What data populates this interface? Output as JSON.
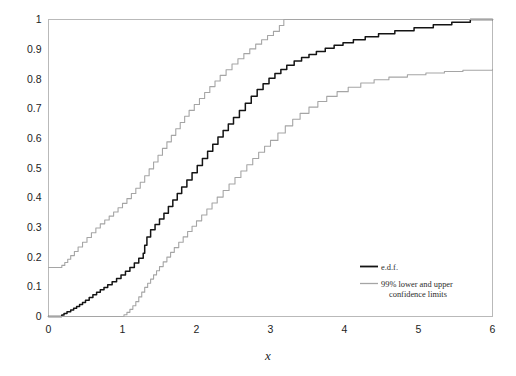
{
  "chart_data": {
    "type": "line",
    "title": "",
    "subtitle": "",
    "xlabel": "x",
    "ylabel": "",
    "xlim": [
      0,
      6
    ],
    "ylim": [
      0,
      1
    ],
    "grid": false,
    "legend_position": "center-right",
    "xticks": [
      "0",
      "1",
      "2",
      "3",
      "4",
      "5",
      "6"
    ],
    "xtick_values": [
      0,
      1,
      2,
      3,
      4,
      5,
      6
    ],
    "yticks": [
      "0",
      "0.1",
      "0.2",
      "0.3",
      "0.4",
      "0.5",
      "0.6",
      "0.7",
      "0.8",
      "0.9",
      "1"
    ],
    "ytick_values": [
      0,
      0.1,
      0.2,
      0.3,
      0.4,
      0.5,
      0.6,
      0.7,
      0.8,
      0.9,
      1.0
    ],
    "colors": {
      "edf": "#141414",
      "confidence": "#a5a5a5",
      "frame": "#b9b9b9",
      "text": "#1d1d1d",
      "background": "#ffffff"
    },
    "series": [
      {
        "name": "e.d.f.",
        "role": "empirical-distribution-function",
        "color": "#141414",
        "step": "post",
        "x": [
          0.0,
          0.18,
          0.21,
          0.25,
          0.3,
          0.34,
          0.38,
          0.42,
          0.46,
          0.5,
          0.55,
          0.6,
          0.65,
          0.7,
          0.75,
          0.8,
          0.86,
          0.92,
          0.98,
          1.04,
          1.1,
          1.16,
          1.22,
          1.28,
          1.3,
          1.33,
          1.38,
          1.44,
          1.5,
          1.56,
          1.62,
          1.68,
          1.74,
          1.8,
          1.87,
          1.94,
          2.01,
          2.08,
          2.15,
          2.22,
          2.29,
          2.36,
          2.43,
          2.5,
          2.58,
          2.66,
          2.74,
          2.82,
          2.9,
          2.98,
          3.06,
          3.14,
          3.22,
          3.32,
          3.42,
          3.52,
          3.62,
          3.74,
          3.86,
          3.98,
          4.12,
          4.28,
          4.46,
          4.68,
          4.94,
          5.2,
          5.45,
          5.7,
          6.0
        ],
        "y": [
          0.0,
          0.005,
          0.01,
          0.016,
          0.022,
          0.028,
          0.034,
          0.04,
          0.047,
          0.055,
          0.064,
          0.073,
          0.082,
          0.09,
          0.098,
          0.107,
          0.117,
          0.128,
          0.14,
          0.152,
          0.165,
          0.18,
          0.196,
          0.213,
          0.24,
          0.268,
          0.292,
          0.31,
          0.328,
          0.348,
          0.37,
          0.392,
          0.414,
          0.436,
          0.46,
          0.484,
          0.508,
          0.532,
          0.556,
          0.58,
          0.604,
          0.626,
          0.648,
          0.67,
          0.694,
          0.718,
          0.742,
          0.764,
          0.784,
          0.802,
          0.818,
          0.832,
          0.846,
          0.86,
          0.872,
          0.882,
          0.892,
          0.903,
          0.913,
          0.922,
          0.932,
          0.942,
          0.952,
          0.962,
          0.972,
          0.982,
          0.991,
          1.0,
          1.0
        ]
      },
      {
        "name": "99% upper confidence limit",
        "role": "upper-confidence-limit",
        "color": "#a5a5a5",
        "step": "post",
        "x": [
          0.0,
          0.15,
          0.18,
          0.22,
          0.26,
          0.3,
          0.35,
          0.4,
          0.46,
          0.52,
          0.58,
          0.64,
          0.7,
          0.76,
          0.82,
          0.88,
          0.94,
          1.0,
          1.06,
          1.12,
          1.18,
          1.24,
          1.3,
          1.36,
          1.42,
          1.48,
          1.54,
          1.6,
          1.66,
          1.72,
          1.78,
          1.84,
          1.9,
          1.97,
          2.04,
          2.11,
          2.18,
          2.25,
          2.32,
          2.4,
          2.48,
          2.56,
          2.64,
          2.72,
          2.8,
          2.88,
          2.96,
          3.04,
          3.12,
          3.18,
          6.0
        ],
        "y": [
          0.165,
          0.165,
          0.172,
          0.182,
          0.193,
          0.205,
          0.219,
          0.234,
          0.25,
          0.266,
          0.282,
          0.298,
          0.312,
          0.325,
          0.338,
          0.352,
          0.366,
          0.381,
          0.397,
          0.414,
          0.432,
          0.452,
          0.474,
          0.497,
          0.52,
          0.543,
          0.566,
          0.588,
          0.61,
          0.632,
          0.653,
          0.674,
          0.694,
          0.714,
          0.734,
          0.754,
          0.774,
          0.793,
          0.812,
          0.831,
          0.85,
          0.868,
          0.885,
          0.901,
          0.917,
          0.932,
          0.946,
          0.96,
          0.98,
          1.0,
          1.0
        ]
      },
      {
        "name": "99% lower confidence limit",
        "role": "lower-confidence-limit",
        "color": "#a5a5a5",
        "step": "post",
        "x": [
          0.0,
          0.98,
          1.02,
          1.06,
          1.1,
          1.14,
          1.18,
          1.22,
          1.26,
          1.3,
          1.34,
          1.38,
          1.42,
          1.46,
          1.5,
          1.55,
          1.6,
          1.65,
          1.7,
          1.76,
          1.82,
          1.88,
          1.94,
          2.0,
          2.07,
          2.14,
          2.21,
          2.28,
          2.36,
          2.44,
          2.52,
          2.6,
          2.68,
          2.76,
          2.84,
          2.92,
          3.0,
          3.1,
          3.2,
          3.3,
          3.4,
          3.52,
          3.64,
          3.76,
          3.9,
          4.05,
          4.22,
          4.4,
          4.6,
          4.85,
          5.1,
          5.35,
          5.6,
          6.0
        ],
        "y": [
          0.0,
          0.0,
          0.006,
          0.014,
          0.024,
          0.036,
          0.05,
          0.066,
          0.082,
          0.098,
          0.112,
          0.126,
          0.14,
          0.154,
          0.168,
          0.184,
          0.2,
          0.216,
          0.232,
          0.25,
          0.268,
          0.286,
          0.304,
          0.322,
          0.342,
          0.362,
          0.382,
          0.402,
          0.424,
          0.446,
          0.468,
          0.49,
          0.511,
          0.532,
          0.553,
          0.573,
          0.593,
          0.618,
          0.642,
          0.664,
          0.684,
          0.705,
          0.724,
          0.741,
          0.757,
          0.772,
          0.786,
          0.797,
          0.806,
          0.814,
          0.82,
          0.825,
          0.829,
          0.832
        ]
      }
    ],
    "legend": [
      {
        "label": "e.d.f.",
        "color": "#141414"
      },
      {
        "label": "99%  lower and upper",
        "label2": "confidence limits",
        "color": "#a5a5a5"
      }
    ]
  }
}
